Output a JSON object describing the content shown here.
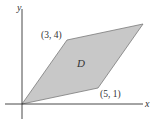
{
  "diagram": {
    "type": "region-in-plane",
    "axes": {
      "x_label": "x",
      "y_label": "y",
      "color": "#333333"
    },
    "region": {
      "name": "D",
      "fill": "#c8c8c8",
      "stroke": "#7a7a7a",
      "vertices": [
        [
          0,
          0
        ],
        [
          5,
          1
        ],
        [
          8,
          5
        ],
        [
          3,
          4
        ]
      ]
    },
    "labels": {
      "vertex_top_left": "(3, 4)",
      "vertex_bottom_right": "(5, 1)",
      "region_label": "D"
    }
  }
}
